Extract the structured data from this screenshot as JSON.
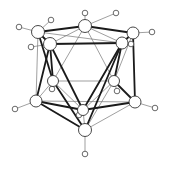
{
  "diagram": {
    "title": "",
    "type": "icosahedral cluster ball-and-stick",
    "colors": {
      "background": "#ffffff",
      "thick_bond": "#1a1a1a",
      "thin_bond": "#777777",
      "atom_fill": "#ffffff",
      "atom_stroke": "#333333"
    },
    "atoms": [
      {
        "id": "A1",
        "x": 85,
        "y": 26,
        "r": 6.5
      },
      {
        "id": "A2",
        "x": 38,
        "y": 32,
        "r": 6.5
      },
      {
        "id": "A3",
        "x": 50,
        "y": 44,
        "r": 6.5
      },
      {
        "id": "A4",
        "x": 133,
        "y": 33,
        "r": 6
      },
      {
        "id": "A5",
        "x": 122,
        "y": 43,
        "r": 6
      },
      {
        "id": "A6",
        "x": 53,
        "y": 81,
        "r": 5.5
      },
      {
        "id": "A7",
        "x": 114,
        "y": 81,
        "r": 5.5
      },
      {
        "id": "A8",
        "x": 36,
        "y": 101,
        "r": 6
      },
      {
        "id": "A9",
        "x": 135,
        "y": 102,
        "r": 6
      },
      {
        "id": "A10",
        "x": 83,
        "y": 110,
        "r": 5.5
      },
      {
        "id": "A11",
        "x": 85,
        "y": 130,
        "r": 6.5
      }
    ],
    "hydrogens": [
      {
        "id": "H1",
        "x": 85,
        "y": 13,
        "parent": "A1"
      },
      {
        "id": "H2",
        "x": 116,
        "y": 13,
        "parent": "A1"
      },
      {
        "id": "H3",
        "x": 51,
        "y": 20,
        "parent": "A2"
      },
      {
        "id": "H4",
        "x": 19,
        "y": 27,
        "parent": "A2"
      },
      {
        "id": "H5",
        "x": 31,
        "y": 47,
        "parent": "A3"
      },
      {
        "id": "H6",
        "x": 152,
        "y": 32,
        "parent": "A4"
      },
      {
        "id": "H7",
        "x": 131,
        "y": 44,
        "parent": "A5"
      },
      {
        "id": "H8",
        "x": 52,
        "y": 89,
        "parent": "A6"
      },
      {
        "id": "H9",
        "x": 117,
        "y": 91,
        "parent": "A7"
      },
      {
        "id": "H10",
        "x": 15,
        "y": 109,
        "parent": "A8"
      },
      {
        "id": "H11",
        "x": 155,
        "y": 108,
        "parent": "A9"
      },
      {
        "id": "H12",
        "x": 79,
        "y": 115,
        "parent": "A10"
      },
      {
        "id": "H13",
        "x": 85,
        "y": 154,
        "parent": "A11"
      }
    ],
    "thick_bonds": [
      [
        "A2",
        "A1"
      ],
      [
        "A1",
        "A4"
      ],
      [
        "A3",
        "A5"
      ],
      [
        "A2",
        "A3"
      ],
      [
        "A4",
        "A5"
      ],
      [
        "A3",
        "A10"
      ],
      [
        "A3",
        "A8"
      ],
      [
        "A5",
        "A10"
      ],
      [
        "A5",
        "A11"
      ],
      [
        "A4",
        "A9"
      ],
      [
        "A8",
        "A10"
      ],
      [
        "A9",
        "A10"
      ],
      [
        "A8",
        "A11"
      ],
      [
        "A2",
        "A6"
      ],
      [
        "A6",
        "A11"
      ],
      [
        "A7",
        "A9"
      ],
      [
        "A3",
        "A6"
      ],
      [
        "A5",
        "A7"
      ]
    ],
    "thin_bonds": [
      [
        "A1",
        "A6"
      ],
      [
        "A1",
        "A7"
      ],
      [
        "A6",
        "A7"
      ],
      [
        "A2",
        "A8"
      ],
      [
        "A4",
        "A7"
      ],
      [
        "A8",
        "A6"
      ],
      [
        "A9",
        "A11"
      ],
      [
        "A7",
        "A11"
      ],
      [
        "A6",
        "A10"
      ],
      [
        "A7",
        "A10"
      ],
      [
        "A2",
        "A5"
      ],
      [
        "A1",
        "A3"
      ],
      [
        "A1",
        "A5"
      ],
      [
        "A10",
        "A11"
      ],
      [
        "A8",
        "A9"
      ]
    ]
  }
}
